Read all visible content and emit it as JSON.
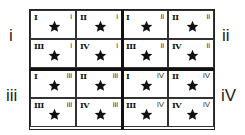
{
  "diagram": {
    "side_labels": {
      "top_left": "i",
      "top_right": "ii",
      "bottom_left": "iii",
      "bottom_right": "iV"
    },
    "blocks": [
      {
        "quadrant": "i",
        "cells": [
          {
            "major": "I",
            "minor": "i",
            "icon": "star-icon"
          },
          {
            "major": "II",
            "minor": "i",
            "icon": "star-icon"
          },
          {
            "major": "III",
            "minor": "i",
            "icon": "star-icon"
          },
          {
            "major": "IV",
            "minor": "i",
            "icon": "star-icon"
          }
        ]
      },
      {
        "quadrant": "ii",
        "cells": [
          {
            "major": "I",
            "minor": "ii",
            "icon": "star-icon"
          },
          {
            "major": "II",
            "minor": "ii",
            "icon": "star-icon"
          },
          {
            "major": "III",
            "minor": "ii",
            "icon": "star-icon"
          },
          {
            "major": "IV",
            "minor": "ii",
            "icon": "star-icon"
          }
        ]
      },
      {
        "quadrant": "iii",
        "cells": [
          {
            "major": "I",
            "minor": "iii",
            "icon": "star-icon"
          },
          {
            "major": "II",
            "minor": "iii",
            "icon": "star-icon"
          },
          {
            "major": "III",
            "minor": "iii",
            "icon": "star-icon"
          },
          {
            "major": "IV",
            "minor": "iii",
            "icon": "star-icon"
          }
        ]
      },
      {
        "quadrant": "iv",
        "cells": [
          {
            "major": "I",
            "minor": "iV",
            "icon": "star-icon"
          },
          {
            "major": "II",
            "minor": "iV",
            "icon": "star-icon"
          },
          {
            "major": "III",
            "minor": "iV",
            "icon": "star-icon"
          },
          {
            "major": "IV",
            "minor": "iV",
            "icon": "star-icon"
          }
        ]
      }
    ],
    "colors": {
      "ink": "#111111",
      "background": "#ffffff"
    }
  }
}
